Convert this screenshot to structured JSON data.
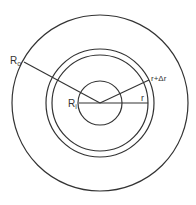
{
  "diagram": {
    "type": "concentric-circles-cross-section",
    "stroke_color": "#333333",
    "background": "#ffffff",
    "center": {
      "x": 100,
      "y": 103
    },
    "circles": [
      {
        "name": "outer-radius",
        "label": "R0",
        "radius": 88
      },
      {
        "name": "shell-outer",
        "label": "r+Δr",
        "radius": 54
      },
      {
        "name": "shell-inner",
        "label": "r",
        "radius": 48
      },
      {
        "name": "inner-radius",
        "label": "Ri",
        "radius": 22
      }
    ],
    "lines": [
      {
        "name": "radius-line-R0",
        "x1": 100,
        "y1": 103,
        "x2": 24,
        "y2": 62
      },
      {
        "name": "radius-line-r-plus-dr",
        "x1": 100,
        "y1": 103,
        "x2": 149,
        "y2": 80
      },
      {
        "name": "radius-line-r",
        "x1": 79,
        "y1": 103,
        "x2": 148,
        "y2": 103
      }
    ],
    "labels": {
      "R0": {
        "main": "R",
        "sub": "o"
      },
      "Ri": {
        "main": "R",
        "sub": "i"
      },
      "r": "r",
      "r_plus_dr": "r+Δr"
    }
  }
}
